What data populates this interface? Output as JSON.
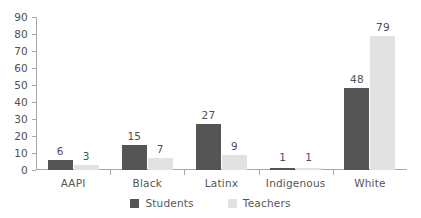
{
  "chart_data": {
    "type": "bar",
    "title": "",
    "xlabel": "",
    "ylabel": "",
    "categories": [
      "AAPI",
      "Black",
      "Latinx",
      "Indigenous",
      "White"
    ],
    "series": [
      {
        "name": "Students",
        "color": "#555555",
        "values": [
          6,
          15,
          27,
          1,
          48
        ]
      },
      {
        "name": "Teachers",
        "color": "#e2e2e2",
        "values": [
          3,
          7,
          9,
          1,
          79
        ]
      }
    ],
    "ylim": [
      0,
      90
    ],
    "yticks": [
      0,
      10,
      20,
      30,
      40,
      50,
      60,
      70,
      80,
      90
    ],
    "ytick_labels": [
      "0",
      "10",
      "20",
      "30",
      "40",
      "50",
      "60",
      "70",
      "80",
      "90"
    ],
    "grid": false,
    "data_labels": true,
    "legend_position": "bottom"
  },
  "legend": {
    "items": [
      {
        "label": "Students",
        "swatch": "students"
      },
      {
        "label": "Teachers",
        "swatch": "teachers"
      }
    ]
  },
  "colors": {
    "students": "#555555",
    "teachers": "#e2e2e2",
    "axis": "#a8a8a8",
    "text": "#565656",
    "background": "#ffffff"
  }
}
